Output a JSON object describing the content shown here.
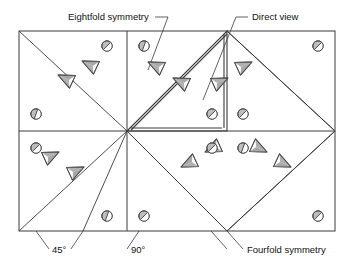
{
  "figure": {
    "background_color": "#ffffff",
    "line_color": "#3a3a3a",
    "marker_outline_color": "#4a4a4a",
    "marker_fill_color": "#b5b5b5",
    "text_color": "#111111",
    "labels": {
      "eightfold": "Eightfold symmetry",
      "direct_view": "Direct view",
      "angle_45": "45°",
      "angle_90": "90°",
      "fourfold": "Fourfold symmetry"
    },
    "frame": {
      "x": 19,
      "y": 31,
      "width": 316,
      "height": 200,
      "center_x": 127,
      "center_y": 131
    },
    "cone_markers": [
      {
        "x": 58,
        "y": 75,
        "rot": 205
      },
      {
        "x": 82,
        "y": 61,
        "rot": 205
      },
      {
        "x": 148,
        "y": 62,
        "rot": 205
      },
      {
        "x": 173,
        "y": 78,
        "rot": 205
      },
      {
        "x": 252,
        "y": 62,
        "rot": 335
      },
      {
        "x": 228,
        "y": 78,
        "rot": 335
      },
      {
        "x": 291,
        "y": 167,
        "rot": 25
      },
      {
        "x": 267,
        "y": 152,
        "rot": 25
      },
      {
        "x": 205,
        "y": 152,
        "rot": 155
      },
      {
        "x": 181,
        "y": 167,
        "rot": 155
      },
      {
        "x": 84,
        "y": 167,
        "rot": 335
      },
      {
        "x": 59,
        "y": 152,
        "rot": 335
      }
    ],
    "circle_markers": [
      {
        "x": 107,
        "y": 46,
        "rot": 45
      },
      {
        "x": 144,
        "y": 46,
        "rot": 20
      },
      {
        "x": 36,
        "y": 114,
        "rot": 20
      },
      {
        "x": 212,
        "y": 114,
        "rot": 45
      },
      {
        "x": 243,
        "y": 114,
        "rot": 45
      },
      {
        "x": 318,
        "y": 46,
        "rot": 45
      },
      {
        "x": 36,
        "y": 148,
        "rot": 45
      },
      {
        "x": 212,
        "y": 148,
        "rot": 45
      },
      {
        "x": 243,
        "y": 148,
        "rot": 20
      },
      {
        "x": 318,
        "y": 216,
        "rot": 45
      },
      {
        "x": 107,
        "y": 216,
        "rot": 20
      },
      {
        "x": 144,
        "y": 216,
        "rot": 45
      }
    ]
  }
}
